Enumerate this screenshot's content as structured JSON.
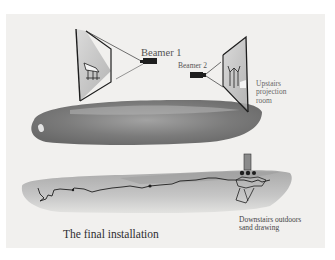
{
  "diagram": {
    "title": "The final installation",
    "labels": {
      "beamer1": "Beamer 1",
      "beamer2": "Beamer 2",
      "upstairs_line1": "Upstairs",
      "upstairs_line2": "projection",
      "upstairs_line3": "room",
      "downstairs_line1": "Downstairs outdoors",
      "downstairs_line2": "sand drawing"
    },
    "elements": [
      {
        "name": "projection-screen-1",
        "icon": "framed-screen"
      },
      {
        "name": "projector-1",
        "icon": "camera-icon"
      },
      {
        "name": "projector-2",
        "icon": "camera-icon"
      },
      {
        "name": "projection-screen-2",
        "icon": "framed-screen"
      },
      {
        "name": "upstairs-ink-wash",
        "icon": "watercolor-blob"
      },
      {
        "name": "downstairs-sand-wash",
        "icon": "watercolor-strip"
      },
      {
        "name": "sand-drawing-line",
        "icon": "scribble-line"
      }
    ],
    "colors": {
      "panel": "#f1f0ee",
      "ink": "#1e1e1e",
      "wash_dark": "#6e6e6e",
      "wash_light": "#b8b8b8"
    }
  }
}
